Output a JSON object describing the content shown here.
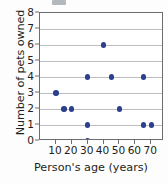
{
  "chart_data": {
    "type": "scatter",
    "title": "",
    "xlabel": "Person's age (years)",
    "ylabel": "Number of pets owned",
    "xlim": [
      0,
      78
    ],
    "ylim": [
      0,
      8
    ],
    "xticks": [
      10,
      20,
      30,
      40,
      50,
      60,
      70
    ],
    "yticks": [
      0,
      1,
      2,
      3,
      4,
      5,
      6,
      7,
      8
    ],
    "xtick_labels": [
      "10",
      "20",
      "30",
      "40",
      "50",
      "60",
      "70"
    ],
    "ytick_labels": [
      "0",
      "1",
      "2",
      "3",
      "4",
      "5",
      "6",
      "7",
      "8"
    ],
    "grid": "horizontal",
    "legend": "none",
    "marker_color": "#2b3f8c",
    "points": [
      {
        "x": 10,
        "y": 3
      },
      {
        "x": 15,
        "y": 2
      },
      {
        "x": 20,
        "y": 2
      },
      {
        "x": 30,
        "y": 4
      },
      {
        "x": 30,
        "y": 1
      },
      {
        "x": 30,
        "y": 0
      },
      {
        "x": 40,
        "y": 6
      },
      {
        "x": 45,
        "y": 4
      },
      {
        "x": 50,
        "y": 2
      },
      {
        "x": 65,
        "y": 4
      },
      {
        "x": 65,
        "y": 1
      },
      {
        "x": 70,
        "y": 1
      }
    ]
  },
  "colors": {
    "marker": "#2b3f8c",
    "gridline": "#b9bcc0",
    "axis": "#6d6e71",
    "text": "#231f20",
    "background": "#ffffff"
  }
}
